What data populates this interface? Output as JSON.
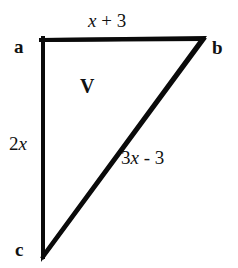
{
  "diagram": {
    "type": "right-triangle",
    "background_color": "#ffffff",
    "stroke_color": "#000000",
    "stroke_width": 4,
    "vertices": [
      {
        "id": "a",
        "label": "a",
        "x": 43,
        "y": 40
      },
      {
        "id": "b",
        "label": "b",
        "x": 203,
        "y": 38
      },
      {
        "id": "c",
        "label": "c",
        "x": 43,
        "y": 256
      }
    ],
    "region_label": "V",
    "edges": [
      {
        "id": "top",
        "from": "a",
        "to": "b",
        "label": "x + 3",
        "variable": "x"
      },
      {
        "id": "left",
        "from": "a",
        "to": "c",
        "label": "2x",
        "variable": "x"
      },
      {
        "id": "hypotenuse",
        "from": "c",
        "to": "b",
        "label": "3x - 3",
        "variable": "x"
      }
    ]
  },
  "labels": {
    "vertex_a": "a",
    "vertex_b": "b",
    "vertex_c": "c",
    "region": "V",
    "edge_top_prefix": "",
    "edge_top_var": "x",
    "edge_top_suffix": " + 3",
    "edge_left_prefix": "2",
    "edge_left_var": "x",
    "edge_left_suffix": "",
    "edge_hyp_prefix": "3",
    "edge_hyp_var": "x",
    "edge_hyp_suffix": " - 3"
  }
}
